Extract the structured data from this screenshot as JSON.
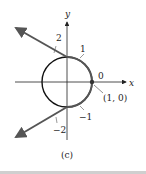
{
  "figure": {
    "caption": "(c)",
    "axes": {
      "x_label": "x",
      "y_label": "y"
    },
    "circle": {
      "type": "unit circle",
      "center": [
        0,
        0
      ],
      "radius": 1
    },
    "point": {
      "label": "(1, 0)",
      "coords": [
        1,
        0
      ]
    },
    "number_line_ticks": [
      {
        "label": "0",
        "position": "at (1, 0)"
      },
      {
        "label": "1",
        "position": "wrapped upper arc"
      },
      {
        "label": "2",
        "position": "upper tangent line"
      },
      {
        "label": "−1",
        "position": "wrapped lower arc"
      },
      {
        "label": "−2",
        "position": "lower tangent line"
      }
    ],
    "colors": {
      "line": "#555555",
      "circle": "#111111",
      "axis": "#222222"
    }
  }
}
